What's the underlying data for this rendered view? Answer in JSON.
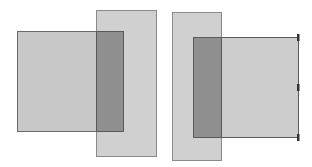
{
  "diagram": {
    "title": "",
    "groups": [
      {
        "id": "left-group",
        "description": "Square rectangle in front, overlapped by tall rectangle behind-right; overlap shown darker",
        "shapes": [
          {
            "id": "left-square",
            "role": "square",
            "fill": "#c8c8c8",
            "stroke": "#6a6a6a"
          },
          {
            "id": "left-tall",
            "role": "tall",
            "fill": "#d0d0d0",
            "stroke": "#8a8a8a"
          }
        ],
        "overlap_fill": "#8f8f8f"
      },
      {
        "id": "right-group",
        "description": "Tall rectangle on left, overlapped by square rectangle with handle ticks on right edge; overlap shown darker",
        "shapes": [
          {
            "id": "right-tall",
            "role": "tall",
            "fill": "#d0d0d0",
            "stroke": "#8a8a8a"
          },
          {
            "id": "right-square",
            "role": "square",
            "fill": "#cdcdcd",
            "stroke": "#5a5a5a"
          }
        ],
        "overlap_fill": "#8f8f8f",
        "handles": 3,
        "handle_color": "#333333"
      }
    ]
  }
}
